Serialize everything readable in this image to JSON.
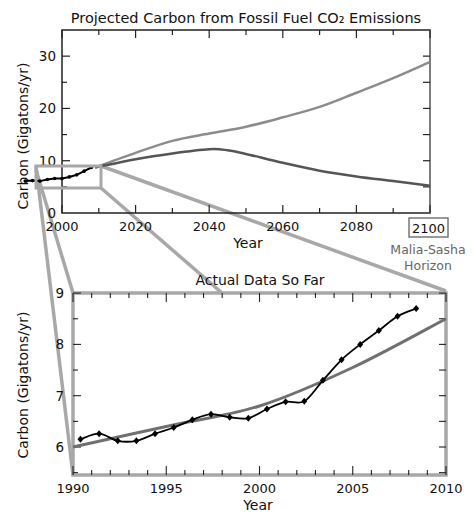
{
  "chart_data": [
    {
      "type": "line",
      "title": "Projected Carbon from Fossil Fuel CO₂ Emissions",
      "xlabel": "Year",
      "ylabel": "Carbon (Gigatons/yr)",
      "xlim": [
        2000,
        2100
      ],
      "ylim": [
        0,
        35
      ],
      "xticks": [
        2000,
        2020,
        2040,
        2060,
        2080,
        2100
      ],
      "yticks": [
        0,
        10,
        20,
        30
      ],
      "annotation": {
        "boxed_tick": "2100",
        "text_line1": "Malia-Sasha",
        "text_line2": "Horizon"
      },
      "series": [
        {
          "name": "Upper projection",
          "color": "#8c8c8c",
          "x": [
            2009,
            2020,
            2030,
            2040,
            2050,
            2060,
            2070,
            2080,
            2090,
            2100
          ],
          "values": [
            8.7,
            11.5,
            13.8,
            15.2,
            16.5,
            18.3,
            20.3,
            23.0,
            25.8,
            28.9
          ]
        },
        {
          "name": "Lower projection",
          "color": "#555555",
          "x": [
            2009,
            2020,
            2030,
            2040,
            2045,
            2050,
            2060,
            2070,
            2080,
            2090,
            2100
          ],
          "values": [
            8.7,
            10.3,
            11.4,
            12.2,
            12.0,
            11.3,
            9.6,
            8.1,
            7.0,
            6.1,
            5.2
          ]
        },
        {
          "name": "Actual data",
          "color": "#000000",
          "x": [
            1990,
            1992,
            1994,
            1996,
            1998,
            2000,
            2002,
            2004,
            2006,
            2008
          ],
          "values": [
            6.1,
            6.2,
            6.1,
            6.4,
            6.6,
            6.6,
            6.9,
            7.3,
            8.0,
            8.7
          ]
        }
      ]
    },
    {
      "type": "line",
      "title": "Actual Data So Far",
      "xlabel": "Year",
      "ylabel": "Carbon (Gigatons/yr)",
      "xlim": [
        1990,
        2010
      ],
      "ylim": [
        5.5,
        9
      ],
      "xticks": [
        1990,
        1995,
        2000,
        2005,
        2010
      ],
      "yticks": [
        6,
        7,
        8,
        9
      ],
      "series": [
        {
          "name": "Actual emissions",
          "color": "#000000",
          "marker": "diamond",
          "x": [
            1990.4,
            1991.4,
            1992.4,
            1993.4,
            1994.4,
            1995.4,
            1996.4,
            1997.4,
            1998.4,
            1999.4,
            2000.4,
            2001.4,
            2002.4,
            2003.4,
            2004.4,
            2005.4,
            2006.4,
            2007.4,
            2008.4
          ],
          "values": [
            6.15,
            6.26,
            6.12,
            6.12,
            6.26,
            6.38,
            6.53,
            6.64,
            6.58,
            6.56,
            6.74,
            6.88,
            6.89,
            7.3,
            7.7,
            8.0,
            8.27,
            8.55,
            8.7
          ]
        },
        {
          "name": "Projection trend",
          "color": "#707070",
          "x": [
            1990,
            1995,
            2000,
            2005,
            2010
          ],
          "values": [
            6.0,
            6.4,
            6.8,
            7.55,
            8.5
          ]
        }
      ]
    }
  ]
}
